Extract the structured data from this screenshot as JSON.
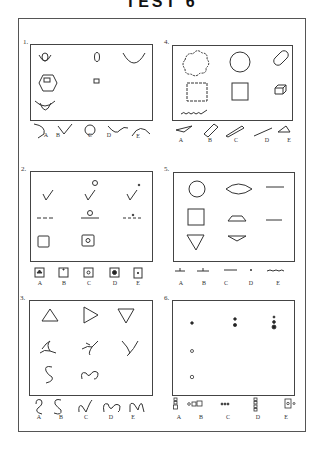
{
  "title": "TEST 6",
  "problems": [
    {
      "number": "1.",
      "answer_labels": [
        "A",
        "B",
        "C",
        "D",
        "E"
      ],
      "description": "Curves, ellipse, hexagon with square, flower shape"
    },
    {
      "number": "2.",
      "answer_labels": [
        "A",
        "B",
        "C",
        "D",
        "E"
      ],
      "description": "Check marks, lines with dot/circle, squares with inner circle"
    },
    {
      "number": "3.",
      "answer_labels": [
        "A",
        "B",
        "C",
        "D",
        "E"
      ],
      "description": "Triangles, loops, S-curves"
    },
    {
      "number": "4.",
      "answer_labels": [
        "A",
        "B",
        "C",
        "D",
        "E"
      ],
      "description": "Cloud/circle/cylinder, wavy square/square/cube, wavy line"
    },
    {
      "number": "5.",
      "answer_labels": [
        "A",
        "B",
        "C",
        "D",
        "E"
      ],
      "description": "Circle/lens/line, square/trapezoid/line, triangle/inverted trapezoid"
    },
    {
      "number": "6.",
      "answer_labels": [
        "A",
        "B",
        "C",
        "D",
        "E"
      ],
      "description": "Dot progressions and small square/circle groupings"
    }
  ],
  "colors": {
    "ink": "#333333",
    "paper": "#ffffff"
  }
}
